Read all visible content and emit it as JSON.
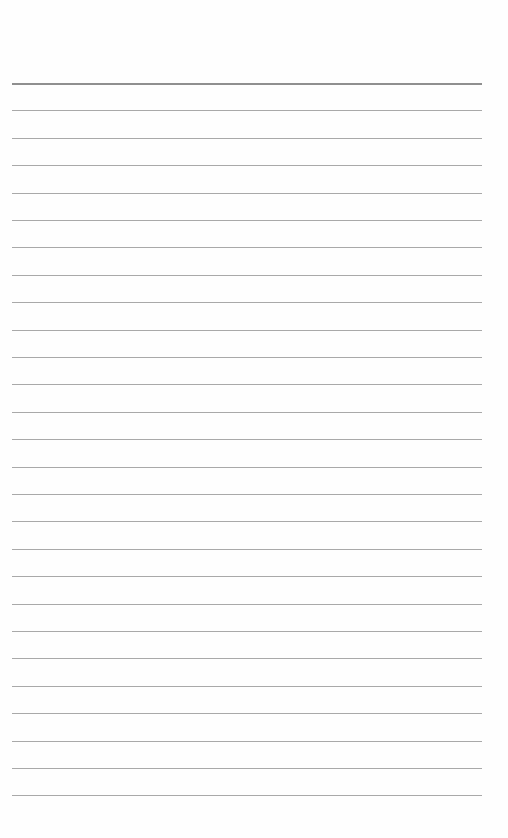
{
  "page": {
    "type": "lined-paper",
    "background_color": "#fefefe",
    "line_color": "#a9a9a9",
    "top_line_color": "#8f8f8f",
    "line_count": 27,
    "first_line_y": 83,
    "line_spacing": 27.4,
    "line_left": 12,
    "line_width": 470,
    "text": []
  }
}
